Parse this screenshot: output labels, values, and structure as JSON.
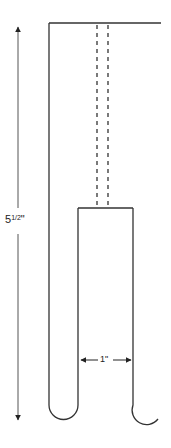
{
  "diagram": {
    "type": "dimensioned-drawing",
    "dimensions": {
      "height": {
        "whole": "5",
        "fraction": "1/2",
        "unit": "\"",
        "label": "5 1/2\""
      },
      "width": {
        "label": "1\""
      }
    },
    "colors": {
      "line": "#333333",
      "background": "#ffffff"
    }
  }
}
